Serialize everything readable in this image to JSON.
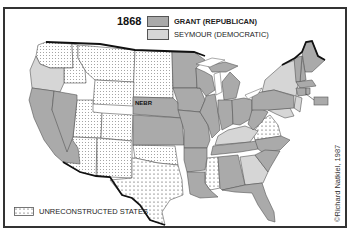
{
  "title": {
    "year": "1868"
  },
  "legend": {
    "items": [
      {
        "label": "GRANT (REPUBLICAN)",
        "color": "#aaaaaa",
        "pattern": "solid-dark-gray"
      },
      {
        "label": "SEYMOUR (DEMOCRATIC)",
        "color": "#d6d6d6",
        "pattern": "solid-light-gray"
      },
      {
        "label": "UNRECONSTRUCTED STATES",
        "color": "#ffffff",
        "pattern": "dotted"
      }
    ]
  },
  "map": {
    "labels": {
      "nebraska": "NEBR"
    },
    "states": {
      "grant": [
        "California",
        "Nevada",
        "Nebraska",
        "Kansas",
        "Minnesota",
        "Iowa",
        "Missouri",
        "Wisconsin",
        "Illinois",
        "Michigan",
        "Indiana",
        "Ohio",
        "West Virginia",
        "Pennsylvania",
        "Tennessee",
        "Arkansas",
        "Louisiana",
        "Alabama",
        "North Carolina",
        "South Carolina",
        "Florida",
        "Maine",
        "New Hampshire",
        "Vermont",
        "Massachusetts",
        "Rhode Island",
        "Connecticut"
      ],
      "seymour": [
        "Oregon",
        "Kentucky",
        "Georgia",
        "New York",
        "New Jersey",
        "Delaware",
        "Maryland"
      ],
      "unreconstructed": [
        "Virginia",
        "Mississippi",
        "Texas"
      ],
      "territories": [
        "Washington",
        "Idaho",
        "Montana",
        "Dakota",
        "Wyoming",
        "Utah",
        "Colorado",
        "Arizona",
        "New Mexico",
        "Indian Territory"
      ]
    }
  },
  "credit": "©Richard Natkiel, 1987"
}
